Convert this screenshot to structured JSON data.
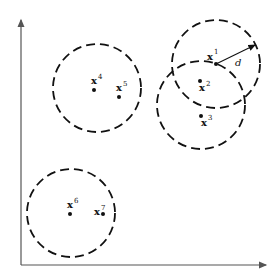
{
  "diagram": {
    "axes": {
      "x_axis": "horizontal arrow",
      "y_axis": "vertical arrow"
    },
    "radius_label": "d",
    "points": [
      {
        "id": "x1",
        "base": "x",
        "sup": "1",
        "cx": 216,
        "cy": 64
      },
      {
        "id": "x2",
        "base": "x",
        "sup": "2",
        "cx": 200,
        "cy": 81
      },
      {
        "id": "x3",
        "base": "x",
        "sup": "3",
        "cx": 201,
        "cy": 116
      },
      {
        "id": "x4",
        "base": "x",
        "sup": "4",
        "cx": 94,
        "cy": 90
      },
      {
        "id": "x5",
        "base": "x",
        "sup": "5",
        "cx": 119,
        "cy": 97
      },
      {
        "id": "x6",
        "base": "x",
        "sup": "6",
        "cx": 70,
        "cy": 214
      },
      {
        "id": "x7",
        "base": "x",
        "sup": "7",
        "cx": 103,
        "cy": 214
      }
    ],
    "circles": [
      {
        "id": "circle-x1",
        "cx": 216,
        "cy": 64,
        "r": 44
      },
      {
        "id": "circle-x2-x3",
        "cx": 201,
        "cy": 105,
        "r": 44
      },
      {
        "id": "circle-x4-x5",
        "cx": 97,
        "cy": 88,
        "r": 44
      },
      {
        "id": "circle-x6-x7",
        "cx": 71,
        "cy": 213,
        "r": 44
      }
    ]
  }
}
